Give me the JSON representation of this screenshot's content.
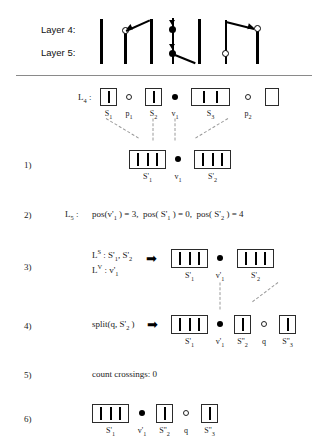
{
  "figure": {
    "top_diagram": {
      "row_labels": [
        "Layer 4:",
        "Layer 5:"
      ],
      "description": "two layers of vertical segments with crossing edges, hollow and solid nodes"
    },
    "rows": [
      {
        "number": "",
        "label": "L₄ :",
        "items": [
          {
            "kind": "box",
            "bars": 1,
            "caption": "S₁"
          },
          {
            "kind": "hollow",
            "caption": "p₁"
          },
          {
            "kind": "box",
            "bars": 1,
            "caption": "S₂"
          },
          {
            "kind": "solid",
            "caption": "v₁"
          },
          {
            "kind": "box",
            "bars": 2,
            "caption": "S₃"
          },
          {
            "kind": "hollow",
            "caption": "p₂"
          },
          {
            "kind": "box",
            "bars": 0,
            "caption": ""
          }
        ]
      },
      {
        "number": "1)",
        "label": "",
        "items": [
          {
            "kind": "box",
            "bars": 3,
            "caption": "S'₁"
          },
          {
            "kind": "solid",
            "caption": "v₁"
          },
          {
            "kind": "box",
            "bars": 3,
            "caption": "S'₂"
          }
        ]
      },
      {
        "number": "2)",
        "label": "L₅ :",
        "text": "pos(v'₁) = 3,   pos(S'₁) = 0,   pos(S'₂) = 4"
      },
      {
        "number": "3)",
        "label_lines": [
          "Lᴸ : S'₁, S'₂",
          "Lᵛ : v'₁"
        ],
        "arrow": "➡",
        "items": [
          {
            "kind": "box",
            "bars": 3,
            "caption": "S'₁"
          },
          {
            "kind": "solid",
            "caption": "v'₁"
          },
          {
            "kind": "box",
            "bars": 3,
            "caption": "S'₂"
          }
        ]
      },
      {
        "number": "4)",
        "label": "split(q, S'₂)",
        "arrow": "➡",
        "items": [
          {
            "kind": "box",
            "bars": 3,
            "caption": "S'₁"
          },
          {
            "kind": "solid",
            "caption": "v'₁"
          },
          {
            "kind": "box",
            "bars": 1,
            "caption": "S''₂"
          },
          {
            "kind": "hollow",
            "caption": "q"
          },
          {
            "kind": "box",
            "bars": 1,
            "caption": "S''₃"
          }
        ]
      },
      {
        "number": "5)",
        "text": "count crossings: 0"
      },
      {
        "number": "6)",
        "items": [
          {
            "kind": "box",
            "bars": 3,
            "caption": "S'₁"
          },
          {
            "kind": "solid",
            "caption": "v'₁"
          },
          {
            "kind": "box",
            "bars": 1,
            "caption": "S''₂"
          },
          {
            "kind": "hollow",
            "caption": "q"
          },
          {
            "kind": "box",
            "bars": 1,
            "caption": "S''₃"
          }
        ]
      }
    ],
    "row_numbers": {
      "r1": "1)",
      "r2": "2)",
      "r3": "3)",
      "r4": "4)",
      "r5": "5)",
      "r6": "6)"
    },
    "labels": {
      "layer4": "Layer 4:",
      "layer5": "Layer 5:",
      "L4": "L",
      "L4sub": "4",
      "L4colon": " :",
      "L5": "L",
      "L5sub": "5",
      "L5colon": " :",
      "row2_text": "pos(v",
      "split_text": "split(q, S",
      "count_text": "count crossings: 0"
    },
    "text": {
      "row2_full": "pos(v'₁ ) = 3,   pos( S'₁ ) = 0,   pos( S'₂ ) = 4",
      "row2_p1": "pos(v",
      "row2_p1sub": "1",
      "row2_p1val": " ) = 3,",
      "row2_p2": "pos( S",
      "row2_p2sub": "1",
      "row2_p2val": " ) = 0,",
      "row2_p3": "pos( S",
      "row2_p3sub": "2",
      "row2_p3val": " ) = 4",
      "row3_l1pre": "L",
      "row3_l1sup": "S",
      "row3_l1post": " : S'",
      "row3_l1sub1": "1",
      "row3_l1mid": ", S'",
      "row3_l1sub2": "2",
      "row3_l2pre": "L",
      "row3_l2sup": "V",
      "row3_l2post": " : v'",
      "row3_l2sub": "1",
      "row4_pre": "split(q, S'",
      "row4_sub": "2",
      "row4_post": " )",
      "row5": "count crossings: 0",
      "arrow_glyph": "➡"
    },
    "captions": {
      "S1": "S",
      "S1sub": "1",
      "p1": "p",
      "p1sub": "1",
      "S2": "S",
      "S2sub": "2",
      "v1": "v",
      "v1sub": "1",
      "S3": "S",
      "S3sub": "3",
      "p2": "p",
      "p2sub": "2",
      "Sp1": "S'",
      "Sp1sub": "1",
      "Sp2": "S'",
      "Sp2sub": "2",
      "vp1": "v'",
      "vp1sub": "1",
      "Spp2": "S''",
      "Spp2sub": "2",
      "Spp3": "S''",
      "Spp3sub": "3",
      "q": "q"
    },
    "colors": {
      "ink": "#000000",
      "rule": "#8a8a8a",
      "dash": "#9a9a9a",
      "background": "#ffffff"
    }
  }
}
